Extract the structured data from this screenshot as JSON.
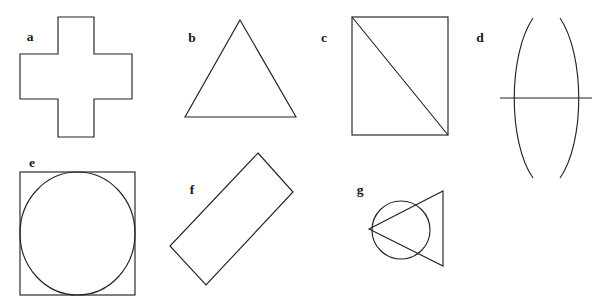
{
  "figure": {
    "width": 592,
    "height": 307,
    "background_color": "#ffffff",
    "stroke_color": "#232323",
    "label_color": "#171717",
    "stroke_width": 1.15,
    "label_font_size": 13.5,
    "label_style": "bold serif",
    "shape_count": 7
  },
  "shapes": [
    {
      "id": "a",
      "label": "a",
      "name": "cross-plus",
      "description": "Greek cross (plus sign) outline, twelve-sided polygon",
      "label_x": 30,
      "label_y": 41,
      "geometry": {
        "type": "polygon",
        "points": "58,17 94,17 94,54 132,54 132,99 94,99 94,137 58,137 58,99 20,99 20,54 58,54",
        "bbox": [
          20,
          17,
          132,
          137
        ],
        "arm_width": 38
      }
    },
    {
      "id": "b",
      "label": "b",
      "name": "triangle",
      "description": "Upright isosceles triangle outline",
      "label_x": 192,
      "label_y": 42,
      "geometry": {
        "type": "polygon",
        "points": "240,20 296,117 185,117",
        "bbox": [
          185,
          20,
          296,
          117
        ],
        "apex": [
          240,
          20
        ],
        "base_left": [
          185,
          117
        ],
        "base_right": [
          296,
          117
        ]
      }
    },
    {
      "id": "c",
      "label": "c",
      "name": "rectangle-with-diagonal",
      "description": "Upright rectangle outline with a diagonal from top-left to bottom-right corner",
      "label_x": 324,
      "label_y": 42,
      "geometry": {
        "type": "rect-diagonal",
        "rect": [
          352,
          17,
          96,
          118
        ],
        "diagonal": [
          352,
          17,
          448,
          135
        ]
      }
    },
    {
      "id": "d",
      "label": "d",
      "name": "double-arc-with-horizontal-line",
      "description": "Two outward-bowing vertical arcs facing away from each other, crossed by a horizontal line",
      "label_x": 480,
      "label_y": 42,
      "geometry": {
        "type": "arcs-line",
        "left_arc": "M 533,18 C 508,55 508,142 533,178",
        "right_arc": "M 560,18 C 585,55 585,142 560,178",
        "line": [
          500,
          98,
          592,
          98
        ]
      }
    },
    {
      "id": "e",
      "label": "e",
      "name": "square-with-inscribed-circle",
      "description": "Square outline containing an inscribed circle touching all four sides",
      "label_x": 32,
      "label_y": 167,
      "geometry": {
        "type": "square-circle",
        "square": [
          20,
          172,
          115,
          123
        ],
        "circle_center": [
          77.5,
          233.5
        ],
        "circle_rx": 57.5,
        "circle_ry": 61.5
      }
    },
    {
      "id": "f",
      "label": "f",
      "name": "rotated-rectangle",
      "description": "Elongated rectangle outline rotated roughly 48 degrees clockwise",
      "label_x": 192,
      "label_y": 194,
      "geometry": {
        "type": "polygon",
        "points": "258,153 293,192 206,285 170,246",
        "bbox": [
          170,
          153,
          293,
          285
        ],
        "rotation_degrees": 48
      }
    },
    {
      "id": "g",
      "label": "g",
      "name": "circle-with-overlapping-triangle",
      "description": "Circle overlapped by a triangle whose apex sits at the circle's left edge and whose vertical right side extends past the circle",
      "label_x": 360,
      "label_y": 194,
      "geometry": {
        "type": "circle-triangle",
        "circle_center": [
          401,
          230
        ],
        "circle_r": 29,
        "triangle": "369,229 443,191 443,266"
      }
    }
  ]
}
